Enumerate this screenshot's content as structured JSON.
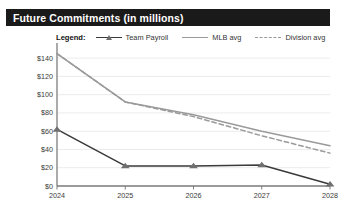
{
  "header": {
    "title": "Future Commitments (in millions)",
    "bar_color": "#1a1a1a",
    "text_color": "#ffffff"
  },
  "legend": {
    "label": "Legend:",
    "position": "top",
    "items": [
      {
        "name": "Team Payroll",
        "marker": "triangle",
        "style": "solid",
        "color": "#3a3a3a"
      },
      {
        "name": "MLB avg",
        "marker": "none",
        "style": "solid",
        "color": "#9a9a9a"
      },
      {
        "name": "Division avg",
        "marker": "none",
        "style": "dashed",
        "color": "#9a9a9a"
      }
    ]
  },
  "chart_data": {
    "type": "line",
    "title": "Future Commitments (in millions)",
    "xlabel": "",
    "ylabel": "",
    "x": [
      "2024",
      "2025",
      "2026",
      "2027",
      "2028"
    ],
    "categories": [
      "2024",
      "2025",
      "2026",
      "2027",
      "2028"
    ],
    "ylim": [
      0,
      150
    ],
    "yticks": [
      0,
      20,
      40,
      60,
      80,
      100,
      120,
      140
    ],
    "ytick_labels": [
      "$0",
      "$20",
      "$40",
      "$60",
      "$80",
      "$100",
      "$120",
      "$140"
    ],
    "grid": true,
    "legend_position": "top",
    "series": [
      {
        "name": "Team Payroll",
        "color": "#3a3a3a",
        "style": "solid",
        "marker": "triangle",
        "values": [
          62,
          22,
          22,
          23,
          2
        ]
      },
      {
        "name": "MLB avg",
        "color": "#9a9a9a",
        "style": "solid",
        "marker": "none",
        "values": [
          145,
          92,
          78,
          60,
          44
        ]
      },
      {
        "name": "Division avg",
        "color": "#9a9a9a",
        "style": "dashed",
        "marker": "none",
        "values": [
          145,
          92,
          76,
          55,
          36
        ]
      }
    ]
  },
  "axes": {
    "y_tick_labels": [
      "$140",
      "$120",
      "$100",
      "$80",
      "$60",
      "$40",
      "$20",
      "$0"
    ],
    "x_tick_labels": [
      "2024",
      "2025",
      "2026",
      "2027",
      "2028"
    ]
  }
}
